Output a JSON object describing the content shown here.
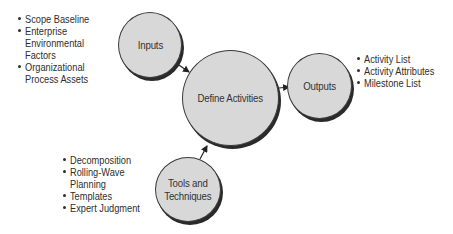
{
  "diagram": {
    "colors": {
      "node_fill": "#d8d8d8",
      "node_border": "#3a3a3a",
      "node_shadow": "#2a2a2a",
      "text": "#2e2e2e",
      "background": "#ffffff"
    },
    "nodes": {
      "inputs": {
        "label": "Inputs"
      },
      "define": {
        "label": "Define Activities"
      },
      "outputs": {
        "label": "Outputs"
      },
      "tools": {
        "label_line1": "Tools and",
        "label_line2": "Techniques"
      }
    },
    "lists": {
      "inputs": [
        {
          "lines": [
            "Scope Baseline"
          ]
        },
        {
          "lines": [
            "Enterprise",
            "Environmental",
            "Factors"
          ]
        },
        {
          "lines": [
            "Organizational",
            "Process Assets"
          ]
        }
      ],
      "outputs": [
        {
          "lines": [
            "Activity List"
          ]
        },
        {
          "lines": [
            "Activity Attributes"
          ]
        },
        {
          "lines": [
            "Milestone List"
          ]
        }
      ],
      "tools": [
        {
          "lines": [
            "Decomposition"
          ]
        },
        {
          "lines": [
            "Rolling-Wave",
            "Planning"
          ]
        },
        {
          "lines": [
            "Templates"
          ]
        },
        {
          "lines": [
            "Expert Judgment"
          ]
        }
      ]
    },
    "edges": [
      {
        "from": "inputs",
        "to": "define"
      },
      {
        "from": "define",
        "to": "outputs"
      },
      {
        "from": "tools",
        "to": "define"
      }
    ]
  }
}
